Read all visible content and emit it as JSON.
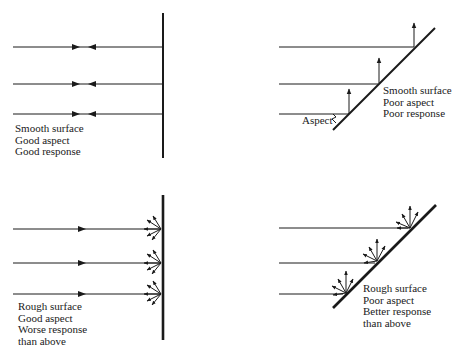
{
  "panels": [
    {
      "id": "smooth-good-aspect",
      "lines": [
        "Smooth surface",
        "Good aspect",
        "Good response"
      ]
    },
    {
      "id": "smooth-poor-aspect",
      "lines": [
        "Smooth surface",
        "Poor aspect",
        "Poor response"
      ],
      "angle_label": "Aspect"
    },
    {
      "id": "rough-good-aspect",
      "lines": [
        "Rough surface",
        "Good aspect",
        "Worse response",
        "than above"
      ]
    },
    {
      "id": "rough-poor-aspect",
      "lines": [
        "Rough surface",
        "Poor aspect",
        "Better response",
        "than above"
      ]
    }
  ],
  "colors": {
    "ink": "#1a1a1a",
    "background": "#ffffff"
  }
}
